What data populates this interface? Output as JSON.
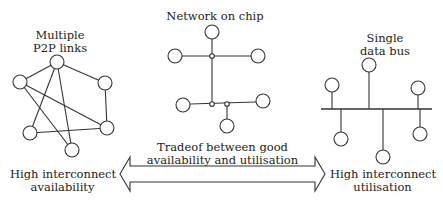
{
  "labels": {
    "p2p_title_line1": "Multiple",
    "p2p_title_line2": "P2P links",
    "noc_title": "Network on chip",
    "bus_title_line1": "Single",
    "bus_title_line2": "data bus",
    "tradeoff_line1": "Tradeof between good",
    "tradeoff_line2": "availability and utilisation",
    "left_end_line1": "High interconnect",
    "left_end_line2": "availability",
    "right_end_line1": "High interconnect",
    "right_end_line2": "utilisation"
  },
  "colors": {
    "stroke": "#333333",
    "background": "#ffffff"
  }
}
